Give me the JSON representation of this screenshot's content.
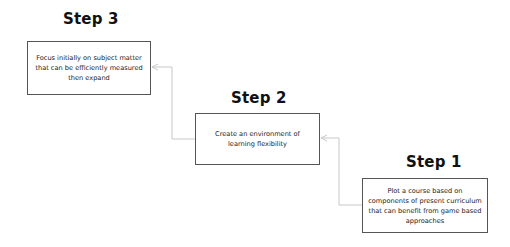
{
  "diagram": {
    "type": "process-steps",
    "connector_color": "#c8c8c8",
    "steps": [
      {
        "title": "Step 3",
        "text": "Focus initially on subject matter that can be efficiently measured then expand"
      },
      {
        "title": "Step 2",
        "text": "Create an environment of learning flexibility"
      },
      {
        "title": "Step 1",
        "text": "Plot a course based on components of present curriculum that can benefit from game based approaches"
      }
    ],
    "edges": [
      {
        "from": "Step 1",
        "to": "Step 2"
      },
      {
        "from": "Step 2",
        "to": "Step 3"
      }
    ]
  }
}
